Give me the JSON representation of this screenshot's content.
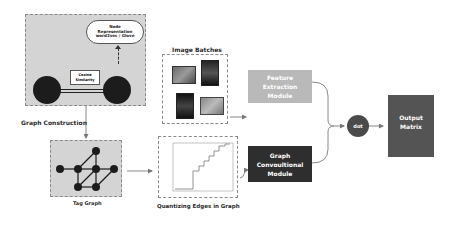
{
  "graph_construction": {
    "cloud_text": "Node Representation word2vec / Glove",
    "similarity_label": "Cosine Similarity",
    "caption": "Graph Construction"
  },
  "tag_graph": {
    "caption": "Tag Graph"
  },
  "image_batches": {
    "caption": "Image Batches"
  },
  "quantizing": {
    "caption": "Quantizing Edges in Graph"
  },
  "modules": {
    "feature_extraction": "Feature Extraction Module",
    "gcn": "Graph Convoultional Module",
    "dot": "dot",
    "output": "Output Matrix"
  },
  "colors": {
    "panel_bg": "#d4d4d4",
    "feature_box": "#b9b9b9",
    "gcn_box": "#2e2e2e",
    "output_box": "#545454",
    "dot_circle": "#4a4a4a",
    "node": "#1c1c1c"
  }
}
